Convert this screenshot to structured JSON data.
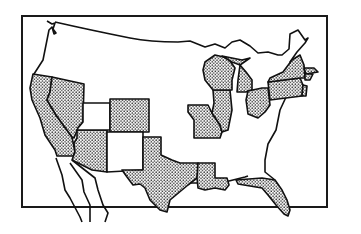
{
  "map": {
    "title": "United States map with shaded states",
    "subject": "Contiguous United States",
    "style": "black-and-white line map, shaded states with dot stipple pattern",
    "colors": {
      "outline": "#111111",
      "background": "#ffffff",
      "stipple": "#222222"
    },
    "shaded_states": [
      "California",
      "Nevada",
      "Arizona",
      "Colorado",
      "Texas",
      "Louisiana",
      "Missouri",
      "Illinois",
      "Wisconsin",
      "Michigan",
      "Ohio",
      "Pennsylvania",
      "New York",
      "New Jersey",
      "Massachusetts",
      "Connecticut",
      "Florida"
    ],
    "unshaded_features": [
      "Washington/Oregon coast region",
      "Utah",
      "New Mexico",
      "Baja California",
      "Southeast coast"
    ],
    "legend": ""
  }
}
